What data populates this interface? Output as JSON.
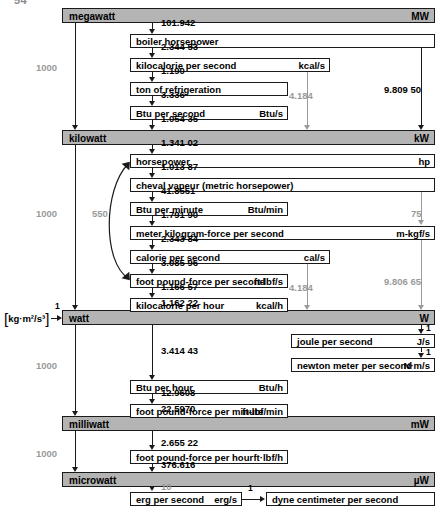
{
  "page_number": "54",
  "bars": [
    {
      "name": "megawatt",
      "symbol": "MW",
      "x": 62,
      "y": 8,
      "w": 373
    },
    {
      "name": "kilowatt",
      "symbol": "kW",
      "x": 62,
      "y": 130,
      "w": 373
    },
    {
      "name": "watt",
      "symbol": "W",
      "x": 62,
      "y": 310,
      "w": 373
    },
    {
      "name": "milliwatt",
      "symbol": "mW",
      "x": 62,
      "y": 416,
      "w": 373
    },
    {
      "name": "microwatt",
      "symbol": "µW",
      "x": 62,
      "y": 472,
      "w": 373
    }
  ],
  "boxes": [
    {
      "name": "boiler horsepower",
      "symbol": "",
      "x": 130,
      "y": 34,
      "w": 305,
      "sym_inline": false
    },
    {
      "name": "kilocalorie per second",
      "symbol": "kcal/s",
      "x": 130,
      "y": 58,
      "w": 200,
      "sym_inline": false
    },
    {
      "name": "ton of refrigeration",
      "symbol": "",
      "x": 130,
      "y": 82,
      "w": 158,
      "sym_inline": false
    },
    {
      "name": "Btu per second",
      "symbol": "Btu/s",
      "x": 130,
      "y": 106,
      "w": 158,
      "sym_inline": false
    },
    {
      "name": "horsepower",
      "symbol": "hp",
      "x": 130,
      "y": 154,
      "w": 305,
      "sym_inline": false
    },
    {
      "name": "cheval vapeur (metric horsepower)",
      "symbol": "",
      "x": 130,
      "y": 178,
      "w": 305,
      "sym_inline": false
    },
    {
      "name": "Btu per minute",
      "symbol": "Btu/min",
      "x": 130,
      "y": 202,
      "w": 158,
      "sym_inline": false
    },
    {
      "name": "meter kilogram-force per second",
      "symbol": "m-kgf/s",
      "x": 130,
      "y": 226,
      "w": 305,
      "sym_inline": false
    },
    {
      "name": "calorie per second",
      "symbol": "cal/s",
      "x": 130,
      "y": 250,
      "w": 200,
      "sym_inline": false
    },
    {
      "name": "foot pound-force per second",
      "symbol": "ft-lbf/s",
      "x": 130,
      "y": 274,
      "w": 158,
      "sym_inline": true
    },
    {
      "name": "kilocalorie per hour",
      "symbol": "kcal/h",
      "x": 130,
      "y": 298,
      "w": 158,
      "sym_inline": false
    },
    {
      "name": "joule per second",
      "symbol": "J/s",
      "x": 291,
      "y": 334,
      "w": 144,
      "sym_inline": false
    },
    {
      "name": "newton meter per second",
      "symbol": "N·m/s",
      "x": 291,
      "y": 358,
      "w": 144,
      "sym_inline": true
    },
    {
      "name": "Btu per hour",
      "symbol": "Btu/h",
      "x": 130,
      "y": 380,
      "w": 158,
      "sym_inline": false
    },
    {
      "name": "foot pound-force per minute",
      "symbol": "ft-lbf/min",
      "x": 130,
      "y": 404,
      "w": 158,
      "sym_inline": true
    },
    {
      "name": "foot pound-force per hour",
      "symbol": "ft·lbf/h",
      "x": 130,
      "y": 450,
      "w": 158,
      "sym_inline": false
    },
    {
      "name": "erg per second",
      "symbol": "erg/s",
      "x": 130,
      "y": 492,
      "w": 112,
      "sym_inline": false
    },
    {
      "name": "dyne centimeter per second",
      "symbol": "",
      "x": 266,
      "y": 492,
      "w": 169,
      "sym_inline": false
    }
  ],
  "factors": [
    {
      "value": "101.942",
      "x": 161,
      "y": 22,
      "gray": false
    },
    {
      "value": "2.344 53",
      "x": 161,
      "y": 46,
      "gray": false
    },
    {
      "value": "1.190",
      "x": 161,
      "y": 70,
      "gray": false
    },
    {
      "value": "3.336",
      "x": 161,
      "y": 94,
      "gray": false
    },
    {
      "value": "1.054 35",
      "x": 161,
      "y": 118,
      "gray": false
    },
    {
      "value": "1.341 02",
      "x": 161,
      "y": 142,
      "gray": false
    },
    {
      "value": "1.013 87",
      "x": 161,
      "y": 166,
      "gray": false
    },
    {
      "value": "41.8551",
      "x": 161,
      "y": 190,
      "gray": false
    },
    {
      "value": "1.791 90",
      "x": 161,
      "y": 214,
      "gray": false
    },
    {
      "value": "2.343 84",
      "x": 161,
      "y": 238,
      "gray": false
    },
    {
      "value": "3.085 96",
      "x": 161,
      "y": 262,
      "gray": false
    },
    {
      "value": "1.166 57",
      "x": 161,
      "y": 286,
      "gray": false
    },
    {
      "value": "1.162 22",
      "x": 161,
      "y": 300,
      "gray": false
    },
    {
      "value": "3.414 43",
      "x": 161,
      "y": 352,
      "gray": false
    },
    {
      "value": "12.9608",
      "x": 161,
      "y": 392,
      "gray": false
    },
    {
      "value": "22.5970",
      "x": 161,
      "y": 416,
      "gray": false
    },
    {
      "value": "2.655 22",
      "x": 161,
      "y": 438,
      "gray": false
    },
    {
      "value": "376.616",
      "x": 161,
      "y": 462,
      "gray": false
    },
    {
      "value": "10",
      "x": 161,
      "y": 484,
      "gray": true
    },
    {
      "value": "1000",
      "x": 36,
      "y": 66,
      "gray": true
    },
    {
      "value": "1000",
      "x": 36,
      "y": 212,
      "gray": true
    },
    {
      "value": "1000",
      "x": 36,
      "y": 364,
      "gray": true
    },
    {
      "value": "1000",
      "x": 36,
      "y": 452,
      "gray": true
    },
    {
      "value": "550",
      "x": 92,
      "y": 212,
      "gray": true
    },
    {
      "value": "4.184",
      "x": 306,
      "y": 94,
      "gray": true
    },
    {
      "value": "4.184",
      "x": 306,
      "y": 286,
      "gray": true
    },
    {
      "value": "75",
      "x": 411,
      "y": 214,
      "gray": true
    },
    {
      "value": "9.809 50",
      "x": 384,
      "y": 88,
      "gray": false
    },
    {
      "value": "9.806 65",
      "x": 384,
      "y": 280,
      "gray": true
    },
    {
      "value": "1",
      "x": 420,
      "y": 324,
      "gray": false
    },
    {
      "value": "1",
      "x": 420,
      "y": 348,
      "gray": false
    },
    {
      "value": "1",
      "x": 55,
      "y": 303,
      "gray": false
    },
    {
      "value": "1",
      "x": 251,
      "y": 484,
      "gray": false
    }
  ],
  "base_unit_bracket": "kg·m²/s³"
}
